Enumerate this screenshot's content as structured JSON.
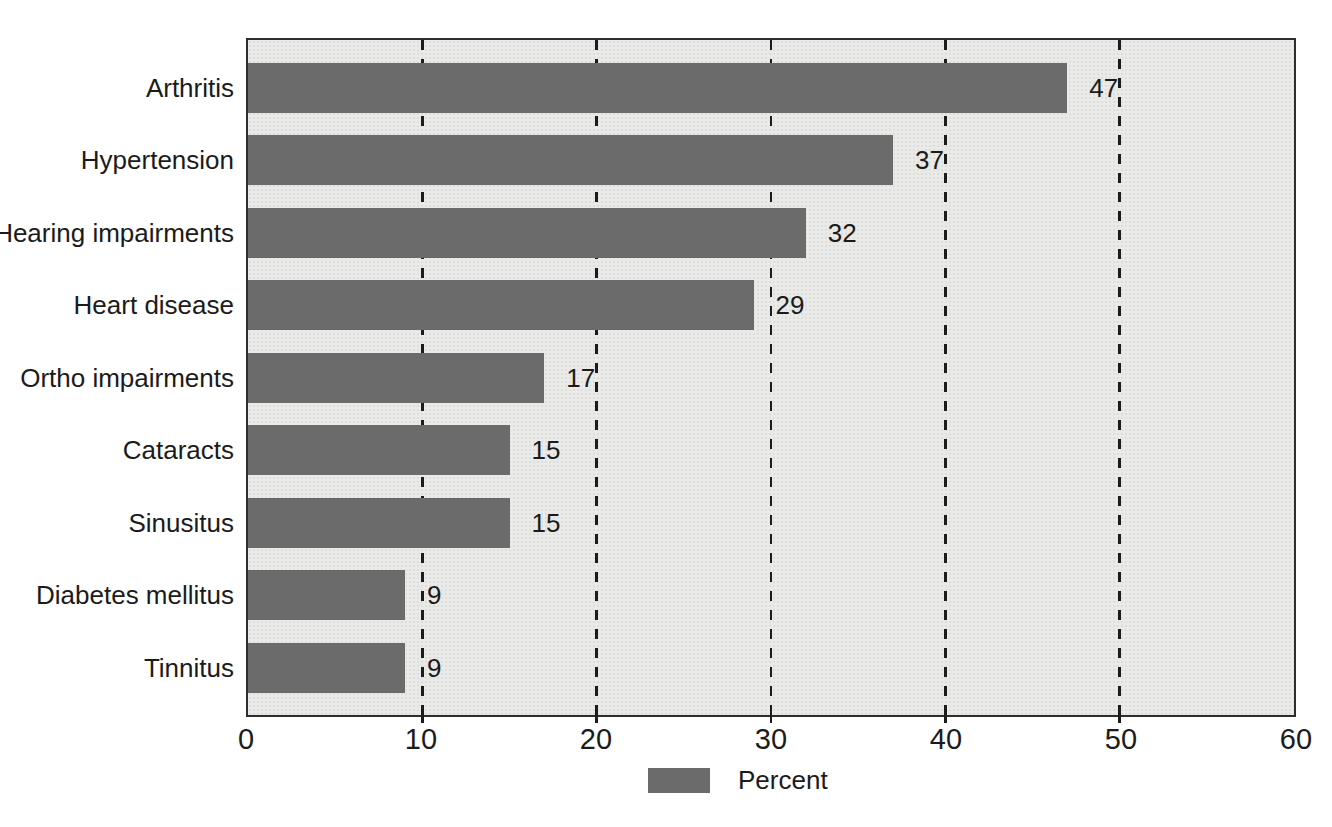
{
  "chart_data": {
    "type": "bar",
    "orientation": "horizontal",
    "title": "",
    "categories": [
      "Arthritis",
      "Hypertension",
      "Hearing impairments",
      "Heart disease",
      "Ortho impairments",
      "Cataracts",
      "Sinusitus",
      "Diabetes mellitus",
      "Tinnitus"
    ],
    "values": [
      47,
      37,
      32,
      29,
      17,
      15,
      15,
      9,
      9
    ],
    "xlim": [
      0,
      60
    ],
    "x_ticks": [
      0,
      10,
      20,
      30,
      40,
      50,
      60
    ],
    "gridlines_at": [
      10,
      20,
      30,
      40,
      50
    ],
    "grid_style": "dashed-vertical",
    "legend": {
      "label": "Percent",
      "position": "bottom-center"
    },
    "colors": {
      "bar": "#6b6b6b",
      "plot_background": "#eaeae8",
      "grid": "#1c1c1c",
      "text": "#1b1b1b",
      "page_background": "#ffffff"
    }
  }
}
